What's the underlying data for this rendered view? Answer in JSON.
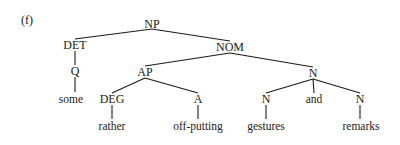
{
  "diagram": {
    "label": "(f)",
    "nodes": [
      {
        "id": "np",
        "text": "NP",
        "x": 152,
        "y": 24
      },
      {
        "id": "det",
        "text": "DET",
        "x": 75,
        "y": 45
      },
      {
        "id": "nom",
        "text": "NOM",
        "x": 230,
        "y": 47
      },
      {
        "id": "q",
        "text": "Q",
        "x": 75,
        "y": 71
      },
      {
        "id": "ap",
        "text": "AP",
        "x": 145,
        "y": 72
      },
      {
        "id": "n_top",
        "text": "N",
        "x": 313,
        "y": 73
      },
      {
        "id": "some",
        "text": "some",
        "x": 71,
        "y": 99
      },
      {
        "id": "deg",
        "text": "DEG",
        "x": 112,
        "y": 99
      },
      {
        "id": "a",
        "text": "A",
        "x": 198,
        "y": 99
      },
      {
        "id": "n_left",
        "text": "N",
        "x": 266,
        "y": 99
      },
      {
        "id": "and",
        "text": "and",
        "x": 314,
        "y": 99
      },
      {
        "id": "n_right",
        "text": "N",
        "x": 360,
        "y": 99
      },
      {
        "id": "rather",
        "text": "rather",
        "x": 112,
        "y": 126
      },
      {
        "id": "offputting",
        "text": "off-putting",
        "x": 198,
        "y": 126
      },
      {
        "id": "gestures",
        "text": "gestures",
        "x": 266,
        "y": 126
      },
      {
        "id": "remarks",
        "text": "remarks",
        "x": 361,
        "y": 126
      }
    ],
    "edges": [
      [
        "np",
        "det"
      ],
      [
        "np",
        "nom"
      ],
      [
        "det",
        "q"
      ],
      [
        "q",
        "some"
      ],
      [
        "nom",
        "ap"
      ],
      [
        "nom",
        "n_top"
      ],
      [
        "ap",
        "deg"
      ],
      [
        "ap",
        "a"
      ],
      [
        "deg",
        "rather"
      ],
      [
        "a",
        "offputting"
      ],
      [
        "n_top",
        "n_left"
      ],
      [
        "n_top",
        "and"
      ],
      [
        "n_top",
        "n_right"
      ],
      [
        "n_left",
        "gestures"
      ],
      [
        "n_right",
        "remarks"
      ]
    ]
  }
}
